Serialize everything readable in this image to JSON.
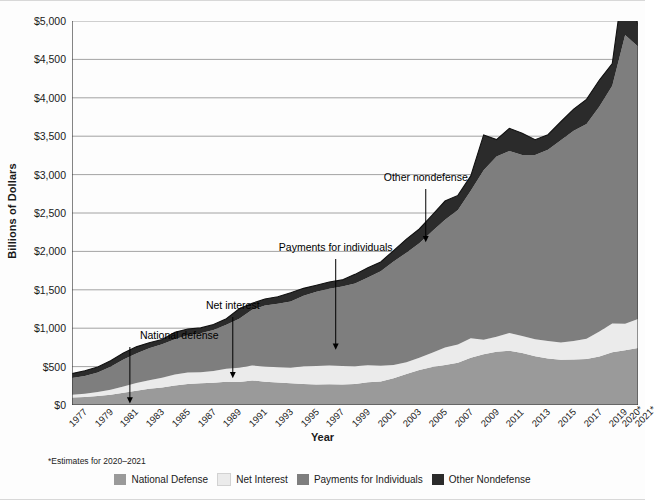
{
  "chart_data": {
    "type": "area",
    "stacked": true,
    "title": "",
    "xlabel": "Year",
    "ylabel": "Billions of Dollars",
    "ylim": [
      0,
      5000
    ],
    "ytick_labels": [
      "$5,000",
      "$4,500",
      "$4,000",
      "$3,500",
      "$3,000",
      "$2,500",
      "$2,000",
      "$1,500",
      "$1,000",
      "$500",
      "$0"
    ],
    "ytick_values": [
      5000,
      4500,
      4000,
      3500,
      3000,
      2500,
      2000,
      1500,
      1000,
      500,
      0
    ],
    "grid": true,
    "legend_position": "bottom",
    "xtick_labels": [
      "1977",
      "1979",
      "1981",
      "1983",
      "1985",
      "1987",
      "1989",
      "1991",
      "1993",
      "1995",
      "1997",
      "1999",
      "2001",
      "2003",
      "2005",
      "2007",
      "2009",
      "2011",
      "2013",
      "2015",
      "2017",
      "2019",
      "2020*",
      "2021*"
    ],
    "x": [
      1977,
      1978,
      1979,
      1980,
      1981,
      1982,
      1983,
      1984,
      1985,
      1986,
      1987,
      1988,
      1989,
      1990,
      1991,
      1992,
      1993,
      1994,
      1995,
      1996,
      1997,
      1998,
      1999,
      2000,
      2001,
      2002,
      2003,
      2004,
      2005,
      2006,
      2007,
      2008,
      2009,
      2010,
      2011,
      2012,
      2013,
      2014,
      2015,
      2016,
      2017,
      2018,
      2019,
      2020,
      2021
    ],
    "series": [
      {
        "name": "National Defense",
        "color": "#9a9a9a",
        "values": [
          97,
          104,
          116,
          134,
          158,
          185,
          210,
          227,
          253,
          273,
          282,
          290,
          304,
          300,
          320,
          303,
          292,
          282,
          272,
          266,
          271,
          268,
          275,
          295,
          306,
          349,
          405,
          455,
          495,
          522,
          551,
          616,
          661,
          694,
          706,
          678,
          634,
          604,
          590,
          593,
          599,
          631,
          687,
          714,
          741
        ]
      },
      {
        "name": "Net Interest",
        "color": "#ebebeb",
        "values": [
          38,
          44,
          52,
          64,
          82,
          100,
          111,
          127,
          143,
          149,
          146,
          152,
          169,
          184,
          194,
          199,
          199,
          203,
          232,
          241,
          244,
          241,
          230,
          223,
          206,
          171,
          153,
          160,
          184,
          227,
          237,
          253,
          187,
          196,
          230,
          220,
          221,
          229,
          223,
          240,
          263,
          325,
          375,
          345,
          378
        ]
      },
      {
        "name": "Payments for Individuals",
        "color": "#7e7e7e",
        "values": [
          215,
          231,
          255,
          301,
          353,
          387,
          419,
          436,
          461,
          487,
          505,
          536,
          573,
          638,
          725,
          794,
          826,
          862,
          920,
          966,
          1000,
          1034,
          1076,
          1143,
          1230,
          1349,
          1425,
          1490,
          1584,
          1663,
          1752,
          1920,
          2209,
          2346,
          2370,
          2357,
          2401,
          2492,
          2635,
          2738,
          2797,
          2931,
          3095,
          3760,
          3550
        ]
      },
      {
        "name": "Other Nondefense",
        "color": "#2b2b2b",
        "values": [
          59,
          66,
          72,
          77,
          85,
          85,
          70,
          62,
          89,
          81,
          71,
          70,
          77,
          131,
          85,
          85,
          92,
          114,
          95,
          87,
          86,
          86,
          120,
          127,
          121,
          142,
          177,
          187,
          209,
          244,
          189,
          194,
          460,
          220,
          297,
          282,
          198,
          195,
          240,
          282,
          321,
          344,
          289,
          850,
          271
        ]
      }
    ],
    "annotations": [
      {
        "label": "National defense",
        "x": 1981.5,
        "points_to": "national-defense-band"
      },
      {
        "label": "Net interest",
        "x": 1989.5,
        "points_to": "net-interest-band"
      },
      {
        "label": "Payments for individuals",
        "x": 1997.5,
        "points_to": "payments-band"
      },
      {
        "label": "Other nondefense",
        "x": 2004.5,
        "points_to": "other-nondefense-band"
      }
    ],
    "footnote": "*Estimates for 2020–2021"
  },
  "legend": {
    "items": [
      {
        "label": "National Defense",
        "color": "#9a9a9a"
      },
      {
        "label": "Net Interest",
        "color": "#ebebeb"
      },
      {
        "label": "Payments for Individuals",
        "color": "#7e7e7e"
      },
      {
        "label": "Other Nondefense",
        "color": "#2b2b2b"
      }
    ]
  }
}
